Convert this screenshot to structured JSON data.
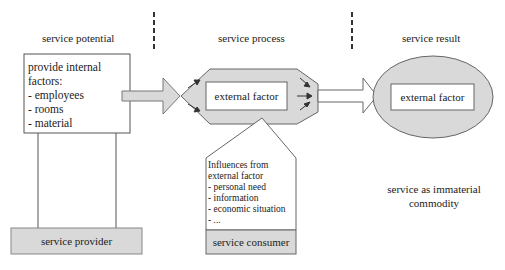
{
  "columns": {
    "potential": "service potential",
    "process": "service process",
    "result": "service result"
  },
  "potential_box": {
    "lines": [
      "provide internal",
      "factors:",
      "- employees",
      "- rooms",
      "- material"
    ]
  },
  "process": {
    "center_label": "external factor"
  },
  "result": {
    "center_label": "external factor",
    "caption_lines": [
      "service as immaterial",
      "commodity"
    ]
  },
  "consumer": {
    "influence_lines": [
      "Influences from",
      "external factor",
      "- personal need",
      "- information",
      "- economic situation",
      "- ..."
    ],
    "label": "service consumer"
  },
  "provider": {
    "label": "service provider"
  },
  "colors": {
    "fill_gray": "#d9d9d9",
    "fill_light": "#e6e6e6",
    "stroke": "#555555",
    "divider": "#333333"
  }
}
